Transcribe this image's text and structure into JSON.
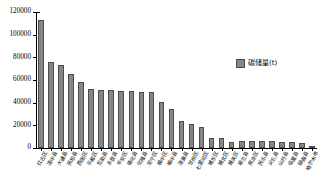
{
  "chart_data": {
    "type": "bar",
    "title": "",
    "xlabel": "",
    "ylabel": "",
    "ylim": [
      0,
      120000
    ],
    "yticks": [
      0,
      20000,
      40000,
      60000,
      80000,
      100000,
      120000
    ],
    "ytick_labels": [
      "0",
      "20000",
      "40000",
      "60000",
      "80000",
      "100000",
      "120000"
    ],
    "grid": false,
    "legend_position": "upper-right",
    "legend": [
      "碳储量(t)"
    ],
    "series_name": "碳储量(t)",
    "bar_color": "#868686",
    "bar_edge_color": "#4d4d4d",
    "categories": [
      "红古区",
      "湟中县",
      "大通县",
      "民和县",
      "西固区",
      "乐都区",
      "互助县",
      "永登县",
      "平安区",
      "循化县",
      "化隆县",
      "安宁区",
      "城中区",
      "榆中县",
      "湟源县",
      "甘州区",
      "七里河区",
      "城东区",
      "城北区",
      "城关区",
      "皋兰县",
      "南凉区",
      "民乐县",
      "尖扎县",
      "山丹县",
      "临夏县",
      "碌曲县",
      "格尔木市"
    ],
    "values": [
      113000,
      75500,
      73000,
      65000,
      58500,
      52000,
      51500,
      51000,
      50500,
      50000,
      49500,
      49000,
      41000,
      34000,
      23500,
      21500,
      18500,
      9000,
      8500,
      5500,
      6500,
      6000,
      6500,
      6000,
      5000,
      5500,
      4000,
      1200
    ]
  }
}
